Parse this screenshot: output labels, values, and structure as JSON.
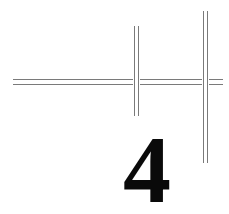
{
  "figure": {
    "numeral": "4",
    "line_color": "#7a7a7a",
    "text_color": "#0a0a0a",
    "background": "#ffffff"
  }
}
